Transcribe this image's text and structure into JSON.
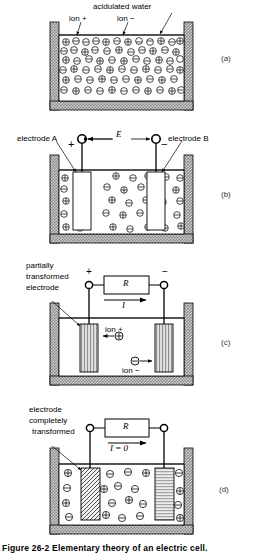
{
  "figure": {
    "caption": "Figure 26-2   Elementary theory of an electric cell.",
    "number": "26-2",
    "title": "Elementary theory of an electric cell."
  },
  "panels": [
    {
      "tag": "(a)",
      "labels": {
        "top": "acidulated water",
        "ion_positive": "ion +",
        "ion_negative": "ion −"
      }
    },
    {
      "tag": "(b)",
      "labels": {
        "electrode_a": "electrode A",
        "electrode_b": "electrode B",
        "emf": "E",
        "sign_left": "+",
        "sign_right": "−"
      }
    },
    {
      "tag": "(c)",
      "labels": {
        "electrode_note_line1": "partially",
        "electrode_note_line2": "transformed",
        "electrode_note_line3": "electrode",
        "resistor": "R",
        "current": "I",
        "sign_left": "+",
        "sign_right": "−",
        "ion_positive": "ion +",
        "ion_negative": "ion −"
      }
    },
    {
      "tag": "(d)",
      "labels": {
        "electrode_note_line1": "electrode",
        "electrode_note_line2": "completely",
        "electrode_note_line3": "transformed",
        "resistor": "R",
        "current": "I = 0"
      }
    }
  ],
  "colors": {
    "ink": "#000000",
    "wall_fill": "#b9b9b9",
    "electrode_fill": "#d0d0d0",
    "paper": "#ffffff"
  }
}
